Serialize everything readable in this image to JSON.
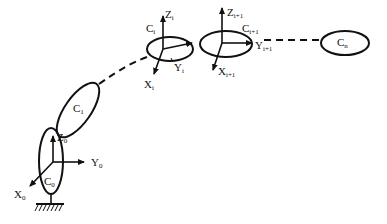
{
  "diagram": {
    "links": [
      {
        "id": "C0",
        "label": "C",
        "sub": "0"
      },
      {
        "id": "C1",
        "label": "C",
        "sub": "1"
      },
      {
        "id": "Ci",
        "label": "C",
        "sub": "i"
      },
      {
        "id": "Ci1",
        "label": "C",
        "sub": "i+1"
      },
      {
        "id": "Cn",
        "label": "C",
        "sub": "n"
      }
    ],
    "frames": [
      {
        "id": "frame0",
        "axes": [
          {
            "label": "Z",
            "sub": "0"
          },
          {
            "label": "Y",
            "sub": "0"
          },
          {
            "label": "X",
            "sub": "0"
          }
        ]
      },
      {
        "id": "framei",
        "axes": [
          {
            "label": "Z",
            "sub": "i"
          },
          {
            "label": "Y",
            "sub": "i"
          },
          {
            "label": "X",
            "sub": "i"
          }
        ]
      },
      {
        "id": "framei1",
        "axes": [
          {
            "label": "Z",
            "sub": "i+1"
          },
          {
            "label": "Y",
            "sub": "i+1"
          },
          {
            "label": "X",
            "sub": "i+1"
          }
        ]
      }
    ],
    "colors": {
      "stroke": "#111111",
      "background": "#ffffff"
    }
  }
}
